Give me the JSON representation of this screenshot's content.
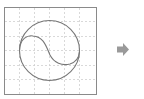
{
  "diagram": {
    "grid": {
      "columns": 6,
      "rows": 6,
      "line_style": "dashed",
      "line_color": "#c8c8c8",
      "border_color": "#8a8a8a"
    },
    "shape": {
      "type": "circle-with-s-curve",
      "stroke_color": "#7a7a7a"
    },
    "arrow": {
      "direction": "right",
      "color": "#9a9a9a",
      "icon": "arrow-right-icon"
    }
  }
}
